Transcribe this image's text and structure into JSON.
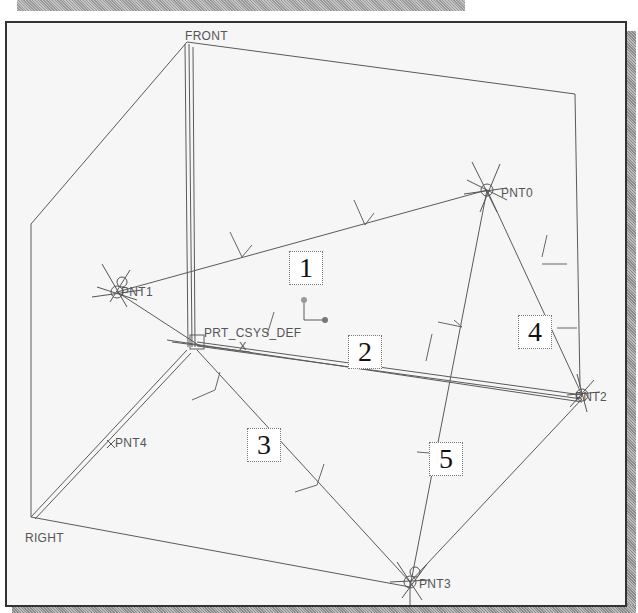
{
  "colors": {
    "background": "#f6f6f6",
    "frame": "#333333",
    "line": "#555555",
    "label": "#555555",
    "callout_text": "#111111",
    "csys_dot": "#888888"
  },
  "datum_planes": [
    {
      "name": "FRONT"
    },
    {
      "name": "RIGHT"
    }
  ],
  "coordinate_system": {
    "label": "PRT_CSYS_DEF",
    "axis_x_label": "X"
  },
  "datum_points": [
    {
      "label": "PNT0"
    },
    {
      "label": "PNT1"
    },
    {
      "label": "PNT2"
    },
    {
      "label": "PNT3"
    },
    {
      "label": "PNT4"
    }
  ],
  "callouts": [
    {
      "number": "1",
      "connects": "PNT1–PNT0"
    },
    {
      "number": "2",
      "connects": "PRT_CSYS_DEF–PNT2"
    },
    {
      "number": "3",
      "connects": "PRT_CSYS_DEF–PNT3"
    },
    {
      "number": "4",
      "connects": "PNT0–PNT2"
    },
    {
      "number": "5",
      "connects": "PNT3–PNT0"
    }
  ],
  "labels": {
    "front": "FRONT",
    "right": "RIGHT",
    "csys": "PRT_CSYS_DEF",
    "pnt0": "PNT0",
    "pnt1": "PNT1",
    "pnt2": "PNT2",
    "pnt3": "PNT3",
    "pnt4": "PNT4",
    "c1": "1",
    "c2": "2",
    "c3": "3",
    "c4": "4",
    "c5": "5"
  }
}
